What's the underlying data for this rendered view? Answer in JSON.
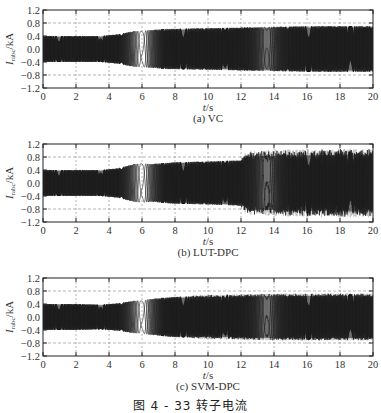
{
  "figure": {
    "caption": "图 4 - 33  转子电流"
  },
  "chart_data": [
    {
      "type": "line",
      "panel_id": "a",
      "subtitle": "(a) VC",
      "title": "",
      "xlabel": "t / s",
      "ylabel": "I_rabc / kA",
      "xlim": [
        0,
        20
      ],
      "ylim": [
        -1.2,
        1.2
      ],
      "xticks": [
        0,
        2,
        4,
        6,
        8,
        10,
        12,
        14,
        16,
        18,
        20
      ],
      "yticks": [
        1.2,
        0.8,
        0.4,
        0.0,
        -0.4,
        -0.8,
        -1.2
      ],
      "ytick_labels": [
        "1.2",
        "0.8",
        "0.4",
        "0.0",
        "-0.4",
        "-0.8",
        "-1.2"
      ],
      "grid": "dashed at y=±0.8 and every x tick",
      "description": "Three-phase rotor current; dense oscillation with amplitude ~0.4 kA for t<4, slip-frequency beats near t≈6 (synchronous crossing), amplitude growing to ~0.65 kA after t≈8 and settling ~0.7 kA",
      "envelope": {
        "t": [
          0,
          2,
          3.5,
          4.5,
          5.5,
          6,
          6.5,
          7.5,
          8,
          10,
          12,
          14,
          16,
          18,
          20
        ],
        "amp": [
          0.4,
          0.4,
          0.4,
          0.45,
          0.55,
          0.55,
          0.58,
          0.62,
          0.62,
          0.64,
          0.66,
          0.68,
          0.7,
          0.7,
          0.7
        ]
      },
      "beat_region": [
        4.5,
        7.5
      ],
      "noise": 0.0
    },
    {
      "type": "line",
      "panel_id": "b",
      "subtitle": "(b) LUT-DPC",
      "title": "",
      "xlabel": "t / s",
      "ylabel": "I_rabc / kA",
      "xlim": [
        0,
        20
      ],
      "ylim": [
        -1.2,
        1.2
      ],
      "xticks": [
        0,
        2,
        4,
        6,
        8,
        10,
        12,
        14,
        16,
        18,
        20
      ],
      "yticks": [
        1.2,
        0.8,
        0.4,
        0.0,
        -0.4,
        -0.8,
        -1.2
      ],
      "ytick_labels": [
        "1.2",
        "0.8",
        "0.4",
        "0.0",
        "-0.4",
        "-0.8",
        "-1.2"
      ],
      "grid": "dashed at y=±0.8 and every x tick",
      "description": "Rotor current under LUT-DPC; similar to VC until t≈12, then higher ripple with noisy envelope reaching ~0.9-1.0 kA",
      "envelope": {
        "t": [
          0,
          2,
          3.5,
          4.5,
          5.5,
          6,
          6.5,
          7.5,
          8,
          10,
          12,
          12.5,
          14,
          16,
          18,
          20
        ],
        "amp": [
          0.4,
          0.4,
          0.4,
          0.45,
          0.58,
          0.6,
          0.58,
          0.62,
          0.64,
          0.66,
          0.7,
          0.85,
          0.88,
          0.9,
          0.92,
          0.92
        ]
      },
      "beat_region": [
        4.5,
        7.5
      ],
      "noise": 0.12,
      "noise_start": 12
    },
    {
      "type": "line",
      "panel_id": "c",
      "subtitle": "(c) SVM-DPC",
      "title": "",
      "xlabel": "t / s",
      "ylabel": "I_rabc / kA",
      "xlim": [
        0,
        20
      ],
      "ylim": [
        -1.2,
        1.2
      ],
      "xticks": [
        0,
        2,
        4,
        6,
        8,
        10,
        12,
        14,
        16,
        18,
        20
      ],
      "yticks": [
        1.2,
        0.8,
        0.4,
        0.0,
        -0.4,
        -0.8,
        -1.2
      ],
      "ytick_labels": [
        "1.2",
        "0.8",
        "0.4",
        "0.0",
        "-0.4",
        "-0.8",
        "-1.2"
      ],
      "grid": "dashed at y=±0.8 and every x tick",
      "description": "Rotor current under SVM-DPC; amplitude ~0.4 kA at start, beats near t≈6 with slightly smaller amplitude, then ~0.6-0.7 kA with mild ripple after t≈8",
      "envelope": {
        "t": [
          0,
          2,
          3.5,
          4.5,
          5.5,
          6,
          6.5,
          7.5,
          8,
          10,
          12,
          14,
          16,
          18,
          20
        ],
        "amp": [
          0.4,
          0.4,
          0.38,
          0.42,
          0.5,
          0.5,
          0.55,
          0.6,
          0.62,
          0.64,
          0.66,
          0.68,
          0.68,
          0.68,
          0.68
        ]
      },
      "beat_region": [
        4.5,
        7.5
      ],
      "noise": 0.04,
      "noise_start": 9
    }
  ]
}
